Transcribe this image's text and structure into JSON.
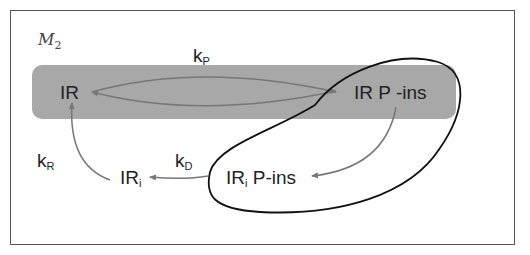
{
  "model": {
    "label": "M",
    "subscript": "2"
  },
  "nodes": {
    "ir": {
      "main": "IR",
      "sub": ""
    },
    "ir_pins": {
      "main": "IR P -ins",
      "sub": ""
    },
    "iri": {
      "main": "IR",
      "sub": "i"
    },
    "iri_pins": {
      "main": "IR",
      "sub": "i",
      "suffix": " P-ins"
    }
  },
  "rates": {
    "kp": {
      "main": "k",
      "sub": "P"
    },
    "kr": {
      "main": "k",
      "sub": "R"
    },
    "kd": {
      "main": "k",
      "sub": "D"
    }
  },
  "colors": {
    "band": "#a8a8a8",
    "arrow": "#777777",
    "loop": "#111111",
    "frame": "#555555"
  }
}
